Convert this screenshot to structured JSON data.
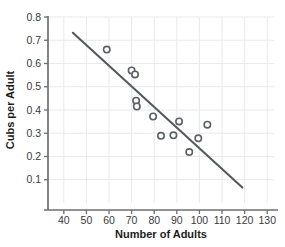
{
  "chart_data": {
    "type": "scatter",
    "title": "",
    "xlabel": "Number of Adults",
    "ylabel": "Cubs per Adult",
    "xlim": [
      33,
      133
    ],
    "ylim": [
      0.0,
      0.8
    ],
    "xticks": [
      "40",
      "50",
      "60",
      "70",
      "80",
      "90",
      "100",
      "110",
      "120",
      "130"
    ],
    "xtick_values": [
      40,
      50,
      60,
      70,
      80,
      90,
      100,
      110,
      120,
      130
    ],
    "yticks": [
      "0.1",
      "0.2",
      "0.3",
      "0.4",
      "0.5",
      "0.6",
      "0.7",
      "0.8"
    ],
    "ytick_values": [
      0.1,
      0.2,
      0.3,
      0.4,
      0.5,
      0.6,
      0.7,
      0.8
    ],
    "grid": true,
    "legend": "none",
    "marker": "open-circle",
    "marker_color": "#5b5f66",
    "grid_color": "#e9e9ee",
    "axis_color": "#6e6e6e",
    "trendline_color": "#55585e",
    "points": [
      {
        "x": 59.0,
        "y": 0.66
      },
      {
        "x": 70.0,
        "y": 0.57
      },
      {
        "x": 71.5,
        "y": 0.553
      },
      {
        "x": 72.0,
        "y": 0.44
      },
      {
        "x": 72.3,
        "y": 0.415
      },
      {
        "x": 79.5,
        "y": 0.372
      },
      {
        "x": 83.0,
        "y": 0.289
      },
      {
        "x": 88.5,
        "y": 0.291
      },
      {
        "x": 91.0,
        "y": 0.351
      },
      {
        "x": 95.5,
        "y": 0.219
      },
      {
        "x": 99.5,
        "y": 0.278
      },
      {
        "x": 103.5,
        "y": 0.337
      }
    ],
    "trendline": {
      "x1": 44.0,
      "y1": 0.732,
      "x2": 119.0,
      "y2": 0.067
    }
  }
}
